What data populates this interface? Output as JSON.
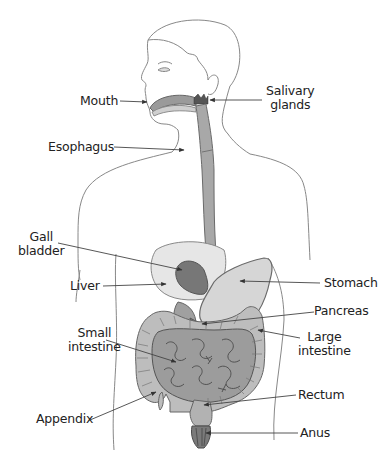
{
  "diagram": {
    "type": "anatomy-labeled-illustration",
    "colors": {
      "outline": "#777777",
      "organ_light": "#e4e4e4",
      "organ_mid": "#b8b8b8",
      "organ_dark": "#8a8a8a",
      "organ_darker": "#6e6e6e",
      "label_text": "#222222",
      "leader_line": "#444444"
    },
    "labels": [
      {
        "id": "mouth",
        "text": "Mouth",
        "side": "left"
      },
      {
        "id": "salivary",
        "lines": [
          "Salivary",
          "glands"
        ],
        "side": "right"
      },
      {
        "id": "esophagus",
        "text": "Esophagus",
        "side": "left"
      },
      {
        "id": "gall",
        "lines": [
          "Gall",
          "bladder"
        ],
        "side": "left"
      },
      {
        "id": "liver",
        "text": "Liver",
        "side": "left"
      },
      {
        "id": "stomach",
        "text": "Stomach",
        "side": "right"
      },
      {
        "id": "pancreas",
        "text": "Pancreas",
        "side": "right"
      },
      {
        "id": "small",
        "lines": [
          "Small",
          "intestine"
        ],
        "side": "left"
      },
      {
        "id": "large",
        "lines": [
          "Large",
          "intestine"
        ],
        "side": "right"
      },
      {
        "id": "rectum",
        "text": "Rectum",
        "side": "right"
      },
      {
        "id": "appendix",
        "text": "Appendix",
        "side": "left"
      },
      {
        "id": "anus",
        "text": "Anus",
        "side": "right"
      }
    ]
  }
}
